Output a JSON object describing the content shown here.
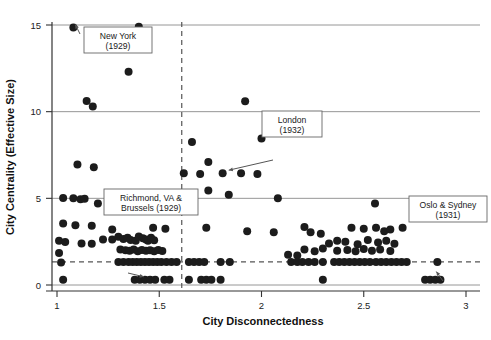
{
  "chart_data": {
    "type": "scatter",
    "title": "",
    "xlabel": "City Disconnectedness",
    "ylabel": "City Centrality (Effective Size)",
    "xlim": [
      0.95,
      3.05
    ],
    "ylim": [
      -0.9,
      16.0
    ],
    "xticks": [
      1,
      1.5,
      2,
      2.5,
      3
    ],
    "xticklabels": [
      "1",
      "1.5",
      "2",
      "2.5",
      "3"
    ],
    "yticks": [
      0,
      5,
      10,
      15
    ],
    "yticklabels": [
      "0",
      "5",
      "10",
      "15"
    ],
    "grid": "horizontal-major",
    "gridlines_y": [
      0,
      5,
      10,
      15
    ],
    "reference_lines": {
      "vertical_dashed_x": 1.61,
      "horizontal_dashed_y": 1.33
    },
    "marker": {
      "shape": "circle",
      "color": "#1c1c1c",
      "size": 5.2
    },
    "points": [
      [
        1.08,
        14.85
      ],
      [
        1.4,
        14.9
      ],
      [
        1.35,
        12.3
      ],
      [
        1.145,
        10.62
      ],
      [
        1.175,
        10.3
      ],
      [
        1.92,
        10.6
      ],
      [
        2.0,
        8.45
      ],
      [
        1.1,
        6.95
      ],
      [
        1.18,
        6.8
      ],
      [
        1.66,
        8.25
      ],
      [
        1.74,
        7.1
      ],
      [
        1.62,
        6.45
      ],
      [
        1.7,
        6.4
      ],
      [
        1.81,
        6.45
      ],
      [
        1.9,
        6.45
      ],
      [
        1.98,
        6.4
      ],
      [
        1.74,
        5.45
      ],
      [
        1.84,
        5.2
      ],
      [
        1.03,
        5.02
      ],
      [
        1.08,
        5.0
      ],
      [
        1.115,
        4.95
      ],
      [
        1.135,
        4.98
      ],
      [
        1.2,
        4.7
      ],
      [
        2.08,
        5.0
      ],
      [
        2.555,
        4.7
      ],
      [
        1.03,
        3.55
      ],
      [
        1.09,
        3.45
      ],
      [
        1.17,
        3.42
      ],
      [
        1.27,
        3.2
      ],
      [
        1.47,
        3.3
      ],
      [
        1.53,
        3.25
      ],
      [
        1.73,
        3.3
      ],
      [
        1.93,
        3.1
      ],
      [
        2.06,
        3.05
      ],
      [
        2.21,
        3.35
      ],
      [
        2.24,
        3.05
      ],
      [
        2.29,
        2.95
      ],
      [
        2.37,
        2.55
      ],
      [
        2.44,
        3.3
      ],
      [
        2.5,
        3.25
      ],
      [
        2.56,
        3.3
      ],
      [
        2.6,
        3.1
      ],
      [
        2.63,
        3.2
      ],
      [
        2.69,
        3.3
      ],
      [
        1.01,
        2.55
      ],
      [
        1.04,
        2.48
      ],
      [
        1.27,
        2.62
      ],
      [
        1.3,
        2.78
      ],
      [
        1.325,
        2.65
      ],
      [
        1.345,
        2.72
      ],
      [
        1.36,
        2.6
      ],
      [
        1.385,
        2.55
      ],
      [
        1.4,
        2.8
      ],
      [
        1.42,
        2.7
      ],
      [
        1.435,
        2.62
      ],
      [
        1.445,
        2.55
      ],
      [
        1.46,
        2.72
      ],
      [
        1.475,
        2.58
      ],
      [
        1.225,
        2.62
      ],
      [
        1.17,
        2.38
      ],
      [
        1.12,
        2.4
      ],
      [
        2.33,
        2.4
      ],
      [
        2.41,
        2.5
      ],
      [
        2.47,
        2.35
      ],
      [
        2.52,
        2.6
      ],
      [
        2.57,
        2.45
      ],
      [
        2.61,
        2.55
      ],
      [
        2.65,
        2.38
      ],
      [
        1.31,
        2.05
      ],
      [
        1.335,
        2.0
      ],
      [
        1.355,
        1.98
      ],
      [
        1.375,
        2.05
      ],
      [
        1.395,
        1.95
      ],
      [
        1.415,
        2.02
      ],
      [
        1.435,
        1.98
      ],
      [
        1.455,
        2.0
      ],
      [
        1.475,
        1.95
      ],
      [
        1.495,
        2.02
      ],
      [
        1.515,
        1.96
      ],
      [
        2.21,
        2.05
      ],
      [
        2.26,
        1.95
      ],
      [
        2.3,
        2.1
      ],
      [
        2.37,
        1.98
      ],
      [
        2.42,
        2.02
      ],
      [
        2.46,
        1.95
      ],
      [
        2.5,
        2.08
      ],
      [
        2.54,
        1.98
      ],
      [
        2.58,
        2.05
      ],
      [
        2.63,
        1.96
      ],
      [
        1.01,
        1.85
      ],
      [
        1.02,
        1.3
      ],
      [
        1.03,
        0.3
      ],
      [
        2.13,
        1.75
      ],
      [
        2.175,
        1.7
      ],
      [
        1.3,
        1.33
      ],
      [
        1.325,
        1.33
      ],
      [
        1.35,
        1.33
      ],
      [
        1.37,
        1.33
      ],
      [
        1.39,
        1.33
      ],
      [
        1.41,
        1.33
      ],
      [
        1.43,
        1.33
      ],
      [
        1.45,
        1.33
      ],
      [
        1.47,
        1.33
      ],
      [
        1.49,
        1.33
      ],
      [
        1.51,
        1.33
      ],
      [
        1.535,
        1.33
      ],
      [
        1.56,
        1.33
      ],
      [
        1.585,
        1.33
      ],
      [
        1.645,
        1.33
      ],
      [
        1.67,
        1.33
      ],
      [
        1.695,
        1.33
      ],
      [
        1.72,
        1.33
      ],
      [
        1.8,
        1.33
      ],
      [
        1.845,
        1.33
      ],
      [
        2.145,
        1.33
      ],
      [
        2.175,
        1.33
      ],
      [
        2.2,
        1.33
      ],
      [
        2.23,
        1.33
      ],
      [
        2.26,
        1.33
      ],
      [
        2.3,
        1.33
      ],
      [
        2.355,
        1.33
      ],
      [
        2.38,
        1.33
      ],
      [
        2.405,
        1.33
      ],
      [
        2.43,
        1.33
      ],
      [
        2.455,
        1.33
      ],
      [
        2.48,
        1.33
      ],
      [
        2.505,
        1.33
      ],
      [
        2.53,
        1.33
      ],
      [
        2.56,
        1.33
      ],
      [
        2.585,
        1.33
      ],
      [
        2.61,
        1.33
      ],
      [
        2.635,
        1.33
      ],
      [
        2.66,
        1.33
      ],
      [
        2.685,
        1.33
      ],
      [
        2.71,
        1.33
      ],
      [
        2.86,
        1.33
      ],
      [
        1.38,
        0.3
      ],
      [
        1.405,
        0.3
      ],
      [
        1.43,
        0.3
      ],
      [
        1.455,
        0.3
      ],
      [
        1.48,
        0.3
      ],
      [
        1.645,
        0.3
      ],
      [
        1.705,
        0.3
      ],
      [
        1.73,
        0.3
      ],
      [
        1.755,
        0.3
      ],
      [
        1.8,
        0.3
      ],
      [
        2.3,
        0.3
      ],
      [
        2.8,
        0.3
      ],
      [
        2.825,
        0.3
      ],
      [
        2.85,
        0.3
      ],
      [
        2.875,
        0.3
      ],
      [
        1.55,
        0.3
      ],
      [
        1.525,
        0.3
      ]
    ],
    "annotations": [
      {
        "id": "new-york",
        "text_lines": [
          "New York",
          "(1929)"
        ],
        "point": [
          1.08,
          14.85
        ]
      },
      {
        "id": "london",
        "text_lines": [
          "London",
          "(1932)"
        ],
        "point": [
          1.83,
          6.45
        ]
      },
      {
        "id": "richmond-brussels",
        "text_lines": [
          "Richmond, VA &",
          "Brussels (1929)"
        ],
        "point": [
          1.415,
          0.3
        ]
      },
      {
        "id": "oslo-sydney",
        "text_lines": [
          "Oslo & Sydney",
          "(1931)"
        ],
        "point": [
          2.845,
          0.6
        ]
      }
    ],
    "colors": {
      "marker": "#1c1c1c",
      "gridline": "#8a8a8a",
      "axis": "#333333",
      "dashed": "#555555",
      "callout_border": "#666666",
      "text": "#111111"
    }
  }
}
